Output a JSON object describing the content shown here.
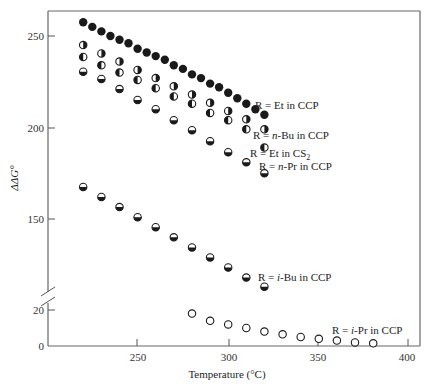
{
  "chart_data": {
    "type": "scatter",
    "title": "",
    "xlabel": "Temperature (°C)",
    "ylabel": "ΔΔG°",
    "xlim": [
      200,
      407
    ],
    "x_ticks": [
      250,
      300,
      350,
      400
    ],
    "y_axis_break": true,
    "y_ticks_upper": [
      150,
      200,
      250
    ],
    "y_ticks_lower": [
      0,
      20
    ],
    "ylim_upper": [
      105,
      262
    ],
    "ylim_lower": [
      0,
      26
    ],
    "grid": false,
    "legend": "inline labels",
    "series": [
      {
        "name": "R = Et in CCP",
        "marker": "filled",
        "x": [
          220,
          225,
          230,
          235,
          240,
          245,
          250,
          255,
          260,
          265,
          270,
          275,
          280,
          285,
          290,
          295,
          300,
          305,
          310,
          315,
          320
        ],
        "y": [
          257.5,
          255,
          252.5,
          250,
          248,
          246,
          243,
          241,
          239,
          237,
          234,
          232,
          229,
          227,
          224,
          222,
          219,
          216,
          213,
          210,
          207
        ]
      },
      {
        "name": "R = n-Bu in CCP",
        "marker": "right-half",
        "x": [
          220,
          230,
          240,
          250,
          260,
          270,
          280,
          290,
          300,
          310,
          320
        ],
        "y": [
          245,
          240.5,
          236,
          231.5,
          227,
          222.5,
          218,
          213.5,
          209,
          204.5,
          199
        ]
      },
      {
        "name": "R = Et in CS2",
        "marker": "left-half",
        "x": [
          220,
          230,
          240,
          250,
          260,
          270,
          280,
          290,
          300,
          310,
          320
        ],
        "y": [
          238.5,
          234,
          230,
          226,
          221.5,
          217,
          213,
          208,
          204,
          199,
          189
        ]
      },
      {
        "name": "R = n-Pr in CCP",
        "marker": "bottom-half",
        "x": [
          220,
          230,
          240,
          250,
          260,
          270,
          280,
          290,
          300,
          310,
          320
        ],
        "y": [
          230.5,
          226.5,
          221,
          215,
          210,
          204,
          198.5,
          192.5,
          186.5,
          181,
          175
        ]
      },
      {
        "name": "R = i-Bu in CCP",
        "marker": "bottom-half",
        "x": [
          220,
          230,
          240,
          250,
          260,
          270,
          280,
          290,
          300,
          310,
          320
        ],
        "y": [
          167.5,
          162,
          156.5,
          151,
          145.5,
          140,
          134.5,
          129,
          123.5,
          118,
          113
        ]
      },
      {
        "name": "R = i-Pr in CCP",
        "marker": "open",
        "x": [
          280,
          290,
          300,
          310,
          320,
          330,
          340,
          350,
          360,
          370,
          380
        ],
        "y": [
          18,
          14,
          12,
          10,
          8,
          6.5,
          5,
          4,
          3,
          2,
          1.5
        ]
      }
    ]
  },
  "labels": {
    "x_axis_title": "Temperature (°C)",
    "y_axis_title": "ΔΔG°",
    "x_ticks": [
      "250",
      "300",
      "350",
      "400"
    ],
    "y_ticks_upper": [
      "250",
      "200",
      "150"
    ],
    "y_ticks_lower": [
      "20",
      "0"
    ],
    "series": {
      "et_ccp": "R = Et in CCP",
      "nbu_ccp_prefix": "R = ",
      "nbu_ccp_italic": "n",
      "nbu_ccp_suffix": "-Bu in CCP",
      "et_cs2_main": "R = Et in CS",
      "et_cs2_sub": "2",
      "npr_ccp_prefix": "R = ",
      "npr_ccp_italic": "n",
      "npr_ccp_suffix": "-Pr in CCP",
      "ibu_ccp_prefix": "R = ",
      "ibu_ccp_italic": "i",
      "ibu_ccp_suffix": "-Bu in CCP",
      "ipr_ccp_prefix": "R = ",
      "ipr_ccp_italic": "i",
      "ipr_ccp_suffix": "-Pr in CCP"
    }
  },
  "colors": {
    "ink": "#1a1a1a",
    "axis": "#555555",
    "background": "#ffffff"
  }
}
